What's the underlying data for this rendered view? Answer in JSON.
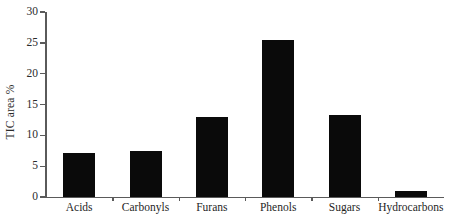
{
  "chart_data": {
    "type": "bar",
    "title": "",
    "xlabel": "",
    "ylabel": "TIC area %",
    "categories": [
      "Acids",
      "Carbonyls",
      "Furans",
      "Phenols",
      "Sugars",
      "Hydrocarbons"
    ],
    "values": [
      7.2,
      7.5,
      13.0,
      25.4,
      13.3,
      1.0
    ],
    "ylim": [
      0,
      30
    ],
    "yticks": [
      0,
      5,
      10,
      15,
      20,
      25,
      30
    ],
    "ytick_labels": [
      "0",
      "5",
      "10",
      "15",
      "20",
      "25",
      "30"
    ],
    "grid": false,
    "legend": false,
    "legend_position": "none",
    "bar_color": "#0a0a0a",
    "axis_color": "#5a5a5a"
  }
}
